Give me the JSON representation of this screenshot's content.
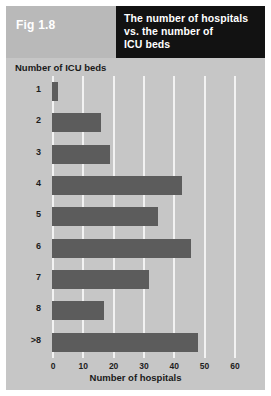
{
  "figure": {
    "label": "Fig 1.8",
    "title_lines": [
      "The number of hospitals",
      "vs. the number of",
      "ICU beds"
    ]
  },
  "colors": {
    "page_background": "#c6c6c6",
    "header_block": "#121212",
    "fig_label_block": "#b9b9b9",
    "bar": "#5c5c5c",
    "gridline": "#f2f2f2",
    "text": "#1d1d1d",
    "title_text": "#ffffff"
  },
  "chart_data": {
    "type": "bar",
    "orientation": "horizontal",
    "title": "The number of hospitals vs. the number of ICU beds",
    "categories": [
      "1",
      "2",
      "3",
      "4",
      "5",
      "6",
      "7",
      "8",
      ">8"
    ],
    "values": [
      2,
      16,
      19,
      43,
      35,
      46,
      32,
      17,
      48
    ],
    "xlabel": "Number of hospitals",
    "ylabel": "Number of ICU beds",
    "xlim": [
      0,
      63
    ],
    "xticks": [
      0,
      10,
      20,
      30,
      40,
      50,
      60
    ],
    "xtick_labels": [
      "0",
      "10",
      "20",
      "30",
      "40",
      "50",
      "60"
    ],
    "grid": "vertical",
    "legend": "none"
  }
}
